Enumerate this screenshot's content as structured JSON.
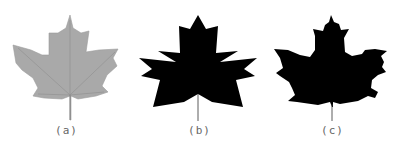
{
  "figure": {
    "panels": [
      {
        "label": "(a)",
        "description": "original maple leaf photograph (gray)",
        "fill": "#a8a8a8"
      },
      {
        "label": "(b)",
        "description": "polygonal approximation silhouette",
        "fill": "#000000"
      },
      {
        "label": "(c)",
        "description": "binary silhouette of leaf",
        "fill": "#000000"
      }
    ],
    "background": "#ffffff",
    "caption_color": "#666666"
  }
}
